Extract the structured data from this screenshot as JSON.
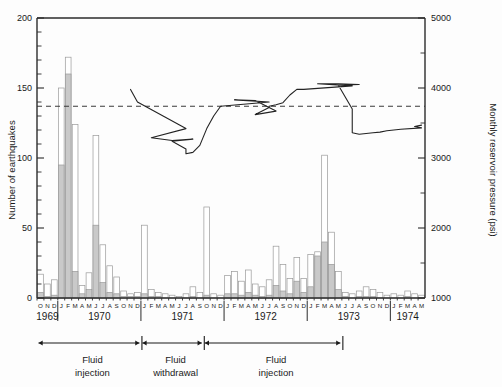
{
  "figure": {
    "background_color": "#fdfdfd",
    "line_color": "#232323",
    "bar_fill_color": "#c9c9c9",
    "bar_edge_color": "#9a9a9a",
    "dashed_ref_color": "#3a3a3a"
  },
  "axes": {
    "left": {
      "title": "Number of earthquakes",
      "ticks": [
        "0",
        "50",
        "100",
        "150",
        "200"
      ],
      "tick_values": [
        0,
        50,
        100,
        150,
        200
      ],
      "minor_step": 10,
      "range": [
        0,
        200
      ]
    },
    "right": {
      "title": "Monthly reservoir pressure (psi)",
      "ticks": [
        "1000",
        "2000",
        "3000",
        "4000",
        "5000"
      ],
      "tick_values": [
        1000,
        2000,
        3000,
        4000,
        5000
      ],
      "minor_step": 500,
      "range": [
        1000,
        5000
      ]
    },
    "bottom": {
      "year_labels": [
        "1969",
        "1970",
        "1971",
        "1972",
        "1973",
        "1974"
      ],
      "month_letters": [
        "O",
        "N",
        "D",
        "J",
        "F",
        "M",
        "A",
        "M",
        "J",
        "J",
        "A",
        "S",
        "O",
        "N",
        "D",
        "J",
        "F",
        "M",
        "A",
        "M",
        "J",
        "J",
        "A",
        "S",
        "O",
        "N",
        "D",
        "J",
        "F",
        "M",
        "A",
        "M",
        "J",
        "J",
        "A",
        "S",
        "O",
        "N",
        "D",
        "J",
        "F",
        "M",
        "A",
        "M",
        "J",
        "J",
        "A",
        "S",
        "O",
        "N",
        "D",
        "J",
        "F",
        "M",
        "A",
        "M"
      ]
    }
  },
  "annotations": {
    "reference_line": {
      "label": "dashed reference",
      "earthquake_value": 137,
      "pressure_value": 3740
    },
    "periods": [
      {
        "label_line1": "Fluid",
        "label_line2": "injection"
      },
      {
        "label_line1": "Fluid",
        "label_line2": "withdrawal"
      },
      {
        "label_line1": "Fluid",
        "label_line2": "injection"
      }
    ]
  },
  "chart_data": {
    "type": "bar",
    "title": "",
    "xlabel": "",
    "ylabel": "Number of earthquakes",
    "y2label": "Monthly reservoir pressure (psi)",
    "ylim": [
      0,
      200
    ],
    "y2lim": [
      1000,
      5000
    ],
    "grid": false,
    "legend": "none",
    "categories": [
      "1969-O",
      "1969-N",
      "1969-D",
      "1970-J",
      "1970-F",
      "1970-M",
      "1970-A",
      "1970-M",
      "1970-J",
      "1970-J",
      "1970-A",
      "1970-S",
      "1970-O",
      "1970-N",
      "1970-D",
      "1971-J",
      "1971-F",
      "1971-M",
      "1971-A",
      "1971-M",
      "1971-J",
      "1971-J",
      "1971-A",
      "1971-S",
      "1971-O",
      "1971-N",
      "1971-D",
      "1972-J",
      "1972-F",
      "1972-M",
      "1972-A",
      "1972-M",
      "1972-J",
      "1972-J",
      "1972-A",
      "1972-S",
      "1972-O",
      "1972-N",
      "1972-D",
      "1973-J",
      "1973-F",
      "1973-M",
      "1973-A",
      "1973-M",
      "1973-J",
      "1973-J",
      "1973-A",
      "1973-S",
      "1973-O",
      "1973-N",
      "1973-D",
      "1974-J",
      "1974-F",
      "1974-M",
      "1974-A",
      "1974-M"
    ],
    "series": [
      {
        "name": "Total earthquakes",
        "values": [
          17,
          10,
          13,
          150,
          172,
          124,
          9,
          18,
          116,
          38,
          23,
          15,
          5,
          3,
          4,
          52,
          6,
          4,
          3,
          2,
          1,
          3,
          8,
          4,
          65,
          3,
          2,
          16,
          19,
          12,
          20,
          10,
          8,
          13,
          37,
          24,
          14,
          29,
          14,
          31,
          33,
          102,
          47,
          19,
          4,
          3,
          5,
          8,
          6,
          4,
          2,
          3,
          2,
          5,
          3,
          2
        ]
      },
      {
        "name": "Shaded subset",
        "values": [
          4,
          1,
          2,
          95,
          160,
          19,
          3,
          6,
          52,
          11,
          4,
          3,
          1,
          1,
          1,
          3,
          1,
          1,
          0,
          0,
          0,
          0,
          1,
          0,
          2,
          0,
          0,
          3,
          3,
          2,
          4,
          2,
          1,
          2,
          9,
          5,
          3,
          12,
          4,
          8,
          30,
          40,
          24,
          6,
          1,
          0,
          1,
          1,
          1,
          0,
          0,
          0,
          0,
          1,
          0,
          0
        ]
      }
    ],
    "overlay_line": {
      "name": "Monthly reservoir pressure",
      "unit": "psi",
      "x_categories": [
        "1970-N",
        "1970-D",
        "1971-J",
        "1971-F",
        "1971-M",
        "1971-A",
        "1971-M",
        "1971-J",
        "1971-J",
        "1971-A",
        "1971-S",
        "1971-O",
        "1971-N",
        "1971-D",
        "1972-J",
        "1972-F",
        "1972-M",
        "1972-A",
        "1972-M",
        "1972-J",
        "1972-J",
        "1972-A",
        "1972-S",
        "1972-O",
        "1972-N",
        "1972-D",
        "1973-J",
        "1973-F",
        "1973-M",
        "1973-A",
        "1973-M",
        "1973-J",
        "1973-J",
        "1973-A",
        "1973-S",
        "1973-O",
        "1973-N",
        "1973-D",
        "1974-J",
        "1974-F",
        "1974-M",
        "1974-A",
        "1974-M"
      ],
      "values": [
        3980,
        3800,
        3420,
        3290,
        3250,
        3270,
        3240,
        3130,
        3060,
        3080,
        3180,
        3420,
        3600,
        3740,
        3800,
        3830,
        3820,
        3670,
        3620,
        3720,
        3740,
        3760,
        3790,
        3900,
        3980,
        3980,
        4030,
        4060,
        4060,
        4050,
        4040,
        3700,
        3360,
        3340,
        3350,
        3360,
        3370,
        3390,
        3400,
        3410,
        3430,
        3450,
        3470
      ]
    }
  }
}
